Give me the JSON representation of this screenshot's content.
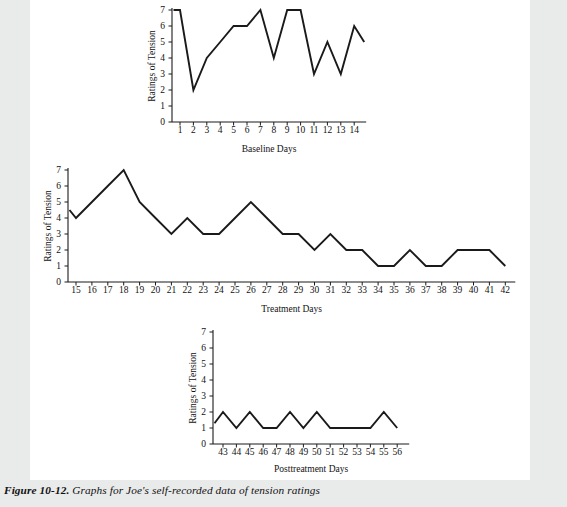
{
  "figure": {
    "number_label": "Figure 10-12.",
    "caption": "Graphs for Joe's self-recorded data of tension ratings"
  },
  "chart_data": [
    {
      "type": "line",
      "id": "baseline",
      "title": "",
      "xlabel": "Baseline Days",
      "ylabel": "Ratings of Tension",
      "ylim": [
        0,
        7
      ],
      "yticks": [
        0,
        1,
        2,
        3,
        4,
        5,
        6,
        7
      ],
      "grid": false,
      "legend": "none",
      "categories": [
        1,
        2,
        3,
        4,
        5,
        6,
        7,
        8,
        9,
        10,
        11,
        12,
        13,
        14
      ],
      "values": [
        7,
        2,
        4,
        5,
        6,
        6,
        7,
        4,
        7,
        7,
        3,
        5,
        3,
        6
      ],
      "lead_in_value": 7,
      "lead_out_value": 5
    },
    {
      "type": "line",
      "id": "treatment",
      "title": "",
      "xlabel": "Treatment Days",
      "ylabel": "Ratings of Tension",
      "ylim": [
        0,
        7
      ],
      "yticks": [
        0,
        1,
        2,
        3,
        4,
        5,
        6,
        7
      ],
      "grid": false,
      "legend": "none",
      "categories": [
        15,
        16,
        17,
        18,
        19,
        20,
        21,
        22,
        23,
        24,
        25,
        26,
        27,
        28,
        29,
        30,
        31,
        32,
        33,
        34,
        35,
        36,
        37,
        38,
        39,
        40,
        41,
        42
      ],
      "values": [
        4,
        5,
        6,
        7,
        5,
        4,
        3,
        4,
        3,
        3,
        4,
        5,
        4,
        3,
        3,
        2,
        3,
        2,
        2,
        1,
        1,
        2,
        1,
        1,
        2,
        2,
        2,
        1
      ],
      "lead_in_value": 4.5,
      "lead_out_value": null
    },
    {
      "type": "line",
      "id": "posttreatment",
      "title": "",
      "xlabel": "Posttreatment Days",
      "ylabel": "Ratings of Tension",
      "ylim": [
        0,
        7
      ],
      "yticks": [
        0,
        1,
        2,
        3,
        4,
        5,
        6,
        7
      ],
      "grid": false,
      "legend": "none",
      "categories": [
        43,
        44,
        45,
        46,
        47,
        48,
        49,
        50,
        51,
        52,
        53,
        54,
        55,
        56
      ],
      "values": [
        2,
        1,
        2,
        1,
        1,
        2,
        1,
        2,
        1,
        1,
        1,
        1,
        2,
        1
      ],
      "lead_in_value": 1.3,
      "lead_out_value": null
    }
  ],
  "colors": {
    "page_background": "#ffffff",
    "outer_background": "#e9eaea",
    "ink": "#1a1a1a"
  }
}
